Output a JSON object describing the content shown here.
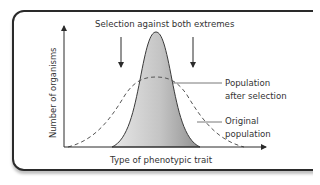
{
  "diagram": {
    "title": "Selection against both extremes",
    "x_axis_label": "Type of phenotypic trait",
    "y_axis_label": "Number of organisms",
    "labels": {
      "after_selection_line1": "Population",
      "after_selection_line2": "after selection",
      "original_line1": "Original",
      "original_line2": "population"
    },
    "curves": [
      {
        "name": "Population after selection",
        "style": "solid, gray gradient fill",
        "peak_x": 156,
        "peak_y": 32
      },
      {
        "name": "Original population",
        "style": "dashed",
        "peak_x": 156,
        "peak_y": 78
      }
    ],
    "arrows": [
      {
        "name": "selection-arrow-left",
        "x": 121
      },
      {
        "name": "selection-arrow-right",
        "x": 193
      }
    ],
    "colors": {
      "line": "#2a2a2a",
      "fill_dark": "#9a9a9a",
      "fill_light": "#e6e6e6",
      "text": "#333333"
    }
  }
}
